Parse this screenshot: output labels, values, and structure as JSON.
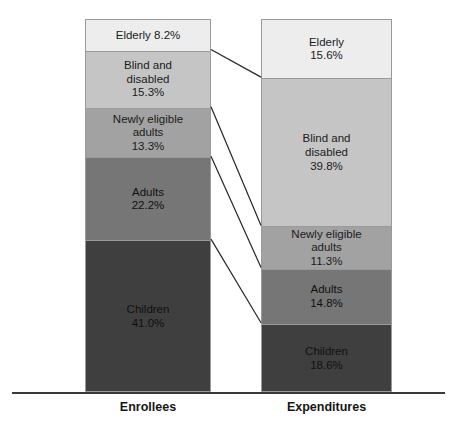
{
  "chart_data": {
    "type": "bar",
    "subtype": "stacked-100-percent",
    "title": "",
    "subtitle": "",
    "xlabel": "",
    "ylabel": "",
    "ylim": [
      0,
      100
    ],
    "grid": false,
    "legend_position": "none",
    "categories": [
      "Enrollees",
      "Expenditures"
    ],
    "series": [
      {
        "name": "Elderly",
        "values": [
          8.2,
          15.6
        ],
        "color": "#ededed"
      },
      {
        "name": "Blind and disabled",
        "values": [
          15.3,
          39.8
        ],
        "color": "#c5c5c5"
      },
      {
        "name": "Newly eligible adults",
        "values": [
          13.3,
          11.3
        ],
        "color": "#a2a2a2"
      },
      {
        "name": "Adults",
        "values": [
          22.2,
          14.8
        ],
        "color": "#767676"
      },
      {
        "name": "Children",
        "values": [
          41.0,
          18.6
        ],
        "color": "#3f3f3f"
      }
    ],
    "annotations": [
      "Connector lines link matching segment boundaries between the two stacked bars"
    ]
  },
  "axis": {
    "labels": [
      {
        "text": "Enrollees"
      },
      {
        "text": "Expenditures"
      }
    ]
  },
  "bars": {
    "enrollees": {
      "name": "Enrollees",
      "segments": [
        {
          "label": "Elderly 8.2%",
          "value": "",
          "pct": 8.2,
          "color": "#ededed"
        },
        {
          "label": "Blind and\ndisabled",
          "value": "15.3%",
          "pct": 15.3,
          "color": "#c5c5c5"
        },
        {
          "label": "Newly eligible\nadults",
          "value": "13.3%",
          "pct": 13.3,
          "color": "#a2a2a2"
        },
        {
          "label": "Adults",
          "value": "22.2%",
          "pct": 22.2,
          "color": "#767676"
        },
        {
          "label": "Children",
          "value": "41.0%",
          "pct": 41.0,
          "color": "#3f3f3f"
        }
      ]
    },
    "expenditures": {
      "name": "Expenditures",
      "segments": [
        {
          "label": "Elderly",
          "value": "15.6%",
          "pct": 15.6,
          "color": "#ededed"
        },
        {
          "label": "Blind and\ndisabled",
          "value": "39.8%",
          "pct": 39.8,
          "color": "#c5c5c5"
        },
        {
          "label": "Newly eligible\nadults",
          "value": "11.3%",
          "pct": 11.3,
          "color": "#a2a2a2"
        },
        {
          "label": "Adults",
          "value": "14.8%",
          "pct": 14.8,
          "color": "#767676"
        },
        {
          "label": "Children",
          "value": "18.6%",
          "pct": 18.6,
          "color": "#3f3f3f"
        }
      ]
    }
  }
}
